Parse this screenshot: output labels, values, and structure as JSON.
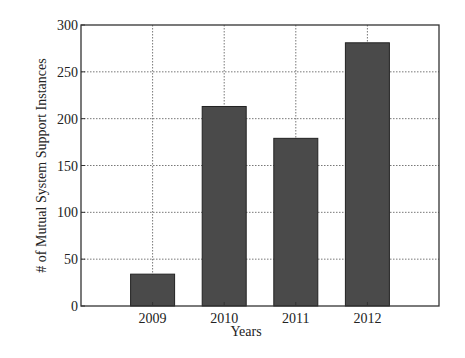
{
  "chart_data": {
    "type": "bar",
    "title": "",
    "xlabel": "Years",
    "ylabel": "# of Mutual System Support Instances",
    "categories": [
      "2009",
      "2010",
      "2011",
      "2012"
    ],
    "values": [
      34,
      213,
      179,
      281
    ],
    "ylim": [
      0,
      300
    ],
    "yticks": [
      0,
      50,
      100,
      150,
      200,
      250,
      300
    ],
    "grid": true,
    "legend": null,
    "bar_color": "#4a4a4a"
  }
}
